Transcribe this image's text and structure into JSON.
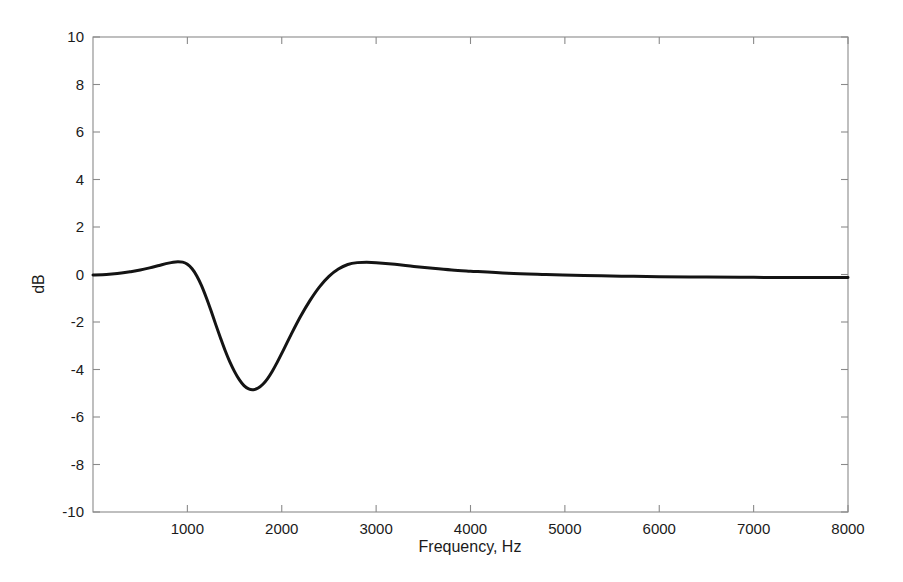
{
  "figure": {
    "background_color": "#ffffff",
    "axis_color": "#8a8a8a",
    "curve_color": "#141414"
  },
  "labels": {
    "y_axis_title": "dB",
    "x_axis_title": "Frequency, Hz",
    "y_ticks": [
      "10",
      "8",
      "6",
      "4",
      "2",
      "0",
      "-2",
      "-4",
      "-6",
      "-8",
      "-10"
    ],
    "x_ticks": [
      "1000",
      "2000",
      "3000",
      "4000",
      "5000",
      "6000",
      "7000",
      "8000"
    ]
  },
  "chart_data": {
    "type": "line",
    "title": "",
    "subtitle": "",
    "xlabel": "Frequency, Hz",
    "ylabel": "dB",
    "xlim": [
      0,
      8000
    ],
    "ylim": [
      -10,
      10
    ],
    "xticks": [
      1000,
      2000,
      3000,
      4000,
      5000,
      6000,
      7000,
      8000
    ],
    "yticks": [
      -10,
      -8,
      -6,
      -4,
      -2,
      0,
      2,
      4,
      6,
      8,
      10
    ],
    "grid": false,
    "legend": null,
    "annotations": [],
    "series": [
      {
        "name": "Notch filter magnitude response",
        "color": "#141414",
        "linewidth": 3,
        "x": [
          0,
          100,
          200,
          300,
          400,
          500,
          600,
          700,
          800,
          850,
          900,
          950,
          1000,
          1050,
          1100,
          1150,
          1200,
          1250,
          1300,
          1350,
          1400,
          1450,
          1500,
          1550,
          1600,
          1650,
          1700,
          1750,
          1800,
          1850,
          1900,
          1950,
          2000,
          2100,
          2200,
          2300,
          2400,
          2500,
          2600,
          2700,
          2800,
          2900,
          3000,
          3200,
          3400,
          3600,
          3800,
          4000,
          4400,
          4800,
          5200,
          5600,
          6000,
          6500,
          7000,
          7500,
          8000
        ],
        "y": [
          -0.02,
          -0.01,
          0.02,
          0.06,
          0.12,
          0.19,
          0.28,
          0.38,
          0.48,
          0.52,
          0.54,
          0.52,
          0.43,
          0.24,
          -0.06,
          -0.47,
          -0.97,
          -1.52,
          -2.1,
          -2.66,
          -3.2,
          -3.68,
          -4.09,
          -4.43,
          -4.68,
          -4.82,
          -4.85,
          -4.78,
          -4.62,
          -4.38,
          -4.07,
          -3.71,
          -3.32,
          -2.52,
          -1.76,
          -1.09,
          -0.52,
          -0.08,
          0.23,
          0.42,
          0.5,
          0.52,
          0.5,
          0.43,
          0.34,
          0.26,
          0.19,
          0.14,
          0.05,
          0.0,
          -0.04,
          -0.07,
          -0.09,
          -0.11,
          -0.12,
          -0.13,
          -0.13
        ]
      }
    ],
    "key_points": {
      "first_peak": {
        "x": 900,
        "y": 0.54
      },
      "notch_minimum": {
        "x": 1700,
        "y": -4.85
      },
      "second_peak": {
        "x": 2900,
        "y": 0.52
      },
      "high_frequency_asymptote": {
        "x": 8000,
        "y": -0.13
      }
    }
  },
  "geometry": {
    "plot_left_px": 93,
    "plot_right_px": 848,
    "plot_top_px": 37,
    "plot_bottom_px": 512
  }
}
